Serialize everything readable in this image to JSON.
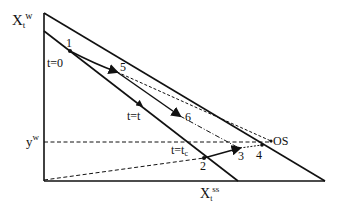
{
  "diagram": {
    "axes": {
      "y_label_main": "X",
      "y_label_sub": "t",
      "y_label_sup": "w",
      "x_label_main": "X",
      "x_label_sub": "t",
      "x_label_sup": "ss",
      "yw_label_main": "y",
      "yw_label_sup": "w"
    },
    "points": {
      "p1": "1",
      "p2": "2",
      "p3": "3",
      "p4": "4",
      "p5": "5",
      "p6": "6",
      "os": "OS"
    },
    "time_labels": {
      "t0": "t=0",
      "tt": "t=t",
      "tc_main": "t=t",
      "tc_sub": "c"
    },
    "colors": {
      "ink": "#111111",
      "background": "#ffffff"
    }
  }
}
